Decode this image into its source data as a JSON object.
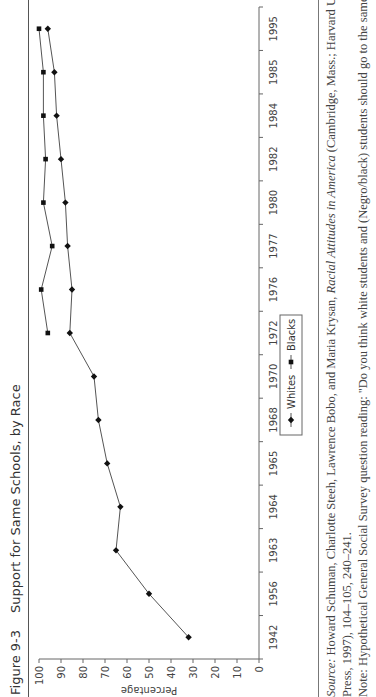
{
  "figure": {
    "number": "Figure 9-3",
    "title": "Support for Same Schools, by Race"
  },
  "source": {
    "label": "Source:",
    "line1_pre": "Howard Schuman, Charlotte Steeh, Lawrence Bobo, and Maria Krysan, ",
    "line1_italic": "Racial Attitudes in America",
    "line1_post": " (Cambridge, Mass.; Harvard University",
    "line2": "Press, 1997), 104–105, 240–241.",
    "line3": "Note: Hypothetical General Social Survey question reading: \"Do you think white students and (Negro/black) students should go to the same schools"
  },
  "chart_data": {
    "type": "line",
    "title": "Support for Same Schools, by Race",
    "xlabel": "",
    "ylabel": "Percentage",
    "ylim": [
      0,
      100
    ],
    "yticks": [
      0,
      10,
      20,
      30,
      40,
      50,
      60,
      70,
      80,
      90,
      100
    ],
    "grid": false,
    "legend_position": "center-bottom",
    "categories": [
      "1942",
      "1956",
      "1963",
      "1964",
      "1965",
      "1968",
      "1970",
      "1972",
      "1976",
      "1977",
      "1980",
      "1982",
      "1984",
      "1985",
      "1995"
    ],
    "series": [
      {
        "name": "Whites",
        "marker": "diamond",
        "values": [
          32,
          50,
          65,
          63,
          69,
          73,
          75,
          86,
          85,
          87,
          88,
          90,
          92,
          93,
          96
        ]
      },
      {
        "name": "Blacks",
        "marker": "square",
        "values": [
          null,
          null,
          null,
          null,
          null,
          null,
          null,
          96,
          99,
          94,
          98,
          97,
          98,
          98,
          100
        ]
      }
    ]
  }
}
